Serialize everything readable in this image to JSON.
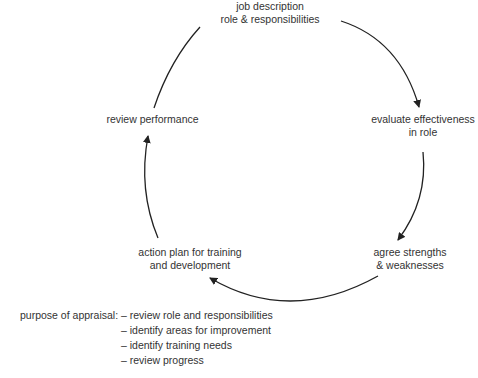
{
  "diagram": {
    "type": "cycle",
    "nodes": [
      {
        "id": "job",
        "lines": [
          "job description",
          "role & responsibilities"
        ]
      },
      {
        "id": "evaluate",
        "lines": [
          "evaluate effectiveness",
          "in role"
        ]
      },
      {
        "id": "agree",
        "lines": [
          "agree strengths",
          "& weaknesses"
        ]
      },
      {
        "id": "action",
        "lines": [
          "action plan for training",
          "and development"
        ]
      },
      {
        "id": "review",
        "lines": [
          "review performance"
        ]
      }
    ],
    "edges": [
      {
        "from": "job",
        "to": "evaluate"
      },
      {
        "from": "evaluate",
        "to": "agree"
      },
      {
        "from": "agree",
        "to": "action"
      },
      {
        "from": "action",
        "to": "review"
      },
      {
        "from": "review",
        "to": "job"
      }
    ],
    "line_color": "#222222"
  },
  "purpose": {
    "heading": "purpose of appraisal:",
    "items": [
      "– review role and responsibilities",
      "– identify areas for improvement",
      "– identify training needs",
      "– review progress"
    ]
  }
}
